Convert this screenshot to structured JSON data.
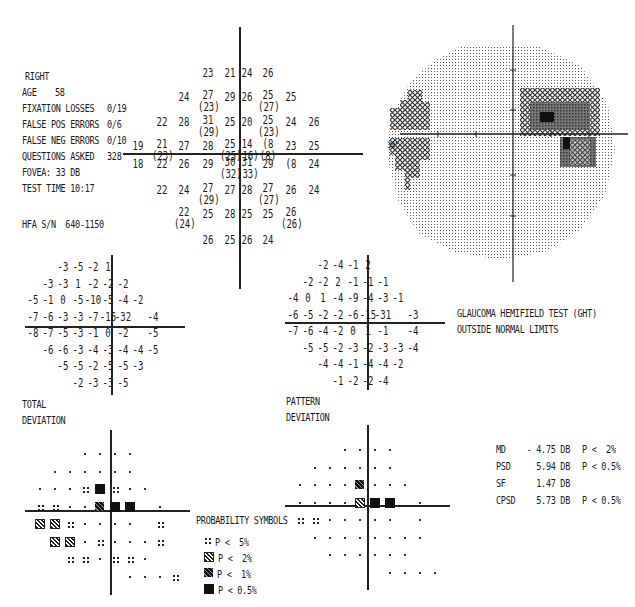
{
  "patient_info": {
    "eye": "RIGHT",
    "age_label": "AGE",
    "age_value": "58",
    "fixation_losses_label": "FIXATION LOSSES",
    "fixation_losses_value": "0/19",
    "false_pos_label": "FALSE POS ERRORS",
    "false_pos_value": "0/6",
    "false_neg_label": "FALSE NEG ERRORS",
    "false_neg_value": "0/10",
    "questions_label": "QUESTIONS ASKED",
    "questions_value": "328",
    "fovea": "FOVEA: 33 DB",
    "test_time": "TEST TIME 10:17",
    "hfa_sn": "HFA S/N  640-1150"
  },
  "threshold_map": {
    "rows": [
      {
        "y": 73,
        "cells": [
          [
            208,
            "23"
          ],
          [
            230,
            "21"
          ],
          [
            247,
            "24"
          ],
          [
            268,
            "26"
          ]
        ]
      },
      {
        "y": 97,
        "cells": [
          [
            184,
            "24"
          ],
          [
            208,
            "27",
            "(23)"
          ],
          [
            230,
            "29"
          ],
          [
            247,
            "26"
          ],
          [
            268,
            "25",
            "(27)"
          ],
          [
            291,
            "25"
          ]
        ]
      },
      {
        "y": 122,
        "cells": [
          [
            162,
            "22"
          ],
          [
            184,
            "28"
          ],
          [
            208,
            "31",
            "(29)"
          ],
          [
            230,
            "25"
          ],
          [
            247,
            "20"
          ],
          [
            268,
            "25",
            "(23)"
          ],
          [
            291,
            "24"
          ],
          [
            314,
            "26"
          ]
        ]
      },
      {
        "y": 146,
        "cells": [
          [
            138,
            "19"
          ],
          [
            162,
            "21",
            "(23)"
          ],
          [
            184,
            "27"
          ],
          [
            208,
            "28"
          ],
          [
            230,
            "25",
            "(25)"
          ],
          [
            247,
            "14",
            "(16)"
          ],
          [
            268,
            "(8",
            "(8)"
          ],
          [
            291,
            "23"
          ],
          [
            314,
            "25"
          ]
        ]
      },
      {
        "y": 164,
        "cells": [
          [
            138,
            "18"
          ],
          [
            162,
            "22"
          ],
          [
            184,
            "26"
          ],
          [
            208,
            "29"
          ],
          [
            230,
            "30",
            "(32)"
          ],
          [
            247,
            "31",
            "(33)"
          ],
          [
            268,
            "29"
          ],
          [
            291,
            "(8"
          ],
          [
            314,
            "24"
          ]
        ]
      },
      {
        "y": 190,
        "cells": [
          [
            162,
            "22"
          ],
          [
            184,
            "24"
          ],
          [
            208,
            "27",
            "(29)"
          ],
          [
            230,
            "27"
          ],
          [
            247,
            "28"
          ],
          [
            268,
            "27",
            "(27)"
          ],
          [
            291,
            "26"
          ],
          [
            314,
            "24"
          ]
        ]
      },
      {
        "y": 214,
        "cells": [
          [
            184,
            "22",
            "(24)"
          ],
          [
            208,
            "25"
          ],
          [
            230,
            "28"
          ],
          [
            247,
            "25"
          ],
          [
            268,
            "25"
          ],
          [
            291,
            "26",
            "(26)"
          ]
        ]
      },
      {
        "y": 240,
        "cells": [
          [
            208,
            "26"
          ],
          [
            230,
            "25"
          ],
          [
            247,
            "26"
          ],
          [
            268,
            "24"
          ]
        ]
      }
    ]
  },
  "grayscale_map": {
    "degree_label": "30°"
  },
  "total_deviation": {
    "label_line1": "TOTAL",
    "label_line2": "DEVIATION",
    "rows": [
      [
        "",
        "",
        "-3",
        "-5",
        "-2",
        "1",
        "",
        ""
      ],
      [
        "",
        "-3",
        "-3",
        "1",
        "-2",
        "-2",
        "-2",
        ""
      ],
      [
        "-5",
        "-1",
        "0",
        "-5",
        "-10",
        "-5",
        "-4",
        "-2"
      ],
      [
        "-7",
        "-6",
        "-3",
        "-3",
        "-7",
        "-16",
        "-32",
        "",
        "-4"
      ],
      [
        "-8",
        "-7",
        "-5",
        "-3",
        "-1",
        "0",
        "-2",
        "",
        "-5"
      ],
      [
        "",
        "-6",
        "-6",
        "-3",
        "-4",
        "-3",
        "-4",
        "-4",
        "-5"
      ],
      [
        "",
        "",
        "-5",
        "-5",
        "-2",
        "-5",
        "-5",
        "-3"
      ],
      [
        "",
        "",
        "",
        "-2",
        "-3",
        "-3",
        "-5"
      ]
    ]
  },
  "pattern_deviation": {
    "label_line1": "PATTERN",
    "label_line2": "DEVIATION",
    "rows": [
      [
        "",
        "",
        "-2",
        "-4",
        "-1",
        "2",
        "",
        ""
      ],
      [
        "",
        "-2",
        "-2",
        "2",
        "-1",
        "-1",
        "-1",
        ""
      ],
      [
        "-4",
        "0",
        "1",
        "-4",
        "-9",
        "-4",
        "-3",
        "-1"
      ],
      [
        "-6",
        "-5",
        "-2",
        "-2",
        "-6",
        "-15",
        "-31",
        "",
        "-3"
      ],
      [
        "-7",
        "-6",
        "-4",
        "-2",
        "0",
        "1",
        "-1",
        "",
        "-4"
      ],
      [
        "",
        "-5",
        "-5",
        "-2",
        "-3",
        "-2",
        "-3",
        "-3",
        "-4"
      ],
      [
        "",
        "",
        "-4",
        "-4",
        "-1",
        "-4",
        "-4",
        "-2"
      ],
      [
        "",
        "",
        "",
        "-1",
        "-2",
        "-2",
        "-4"
      ]
    ]
  },
  "ght": {
    "line1": "GLAUCOMA HEMIFIELD TEST (GHT)",
    "line2": "OUTSIDE NORMAL LIMITS"
  },
  "global_indices": [
    {
      "name": "MD",
      "value": "- 4.75 DB",
      "p": "P <  2%"
    },
    {
      "name": "PSD",
      "value": "5.94 DB",
      "p": "P < 0.5%"
    },
    {
      "name": "SF",
      "value": "1.47 DB",
      "p": ""
    },
    {
      "name": "CPSD",
      "value": "5.73 DB",
      "p": "P < 0.5%"
    }
  ],
  "probability_legend": {
    "title": "PROBABILITY SYMBOLS",
    "items": [
      {
        "symbol": "p5",
        "label": "P <  5%"
      },
      {
        "symbol": "p2",
        "label": "P <  2%"
      },
      {
        "symbol": "p1",
        "label": "P <  1%"
      },
      {
        "symbol": "p05",
        "label": "P < 0.5%"
      }
    ]
  },
  "total_prob_map": [
    [
      "n",
      "n",
      "n",
      "n"
    ],
    [
      "n",
      "n",
      "n",
      "n",
      "n",
      "n"
    ],
    [
      "n",
      "n",
      "n",
      "p5",
      "p05",
      "p5",
      "n",
      "n"
    ],
    [
      "p5",
      "p5",
      "n",
      "n",
      "p1",
      "p05",
      "p05",
      "",
      "n"
    ],
    [
      "p2",
      "p2",
      "p5",
      "n",
      "n",
      "n",
      "n",
      "",
      "p5"
    ],
    [
      "",
      "p2",
      "p2",
      "n",
      "p5",
      "n",
      "n",
      "n",
      "p5"
    ],
    [
      "",
      "",
      "p5",
      "p5",
      "n",
      "p5",
      "p5",
      "n"
    ],
    [
      "",
      "",
      "",
      "n",
      "n",
      "n",
      "p5"
    ]
  ],
  "pattern_prob_map": [
    [
      "n",
      "n",
      "n",
      "n"
    ],
    [
      "n",
      "n",
      "n",
      "n",
      "n",
      "n"
    ],
    [
      "n",
      "n",
      "n",
      "n",
      "p1",
      "n",
      "n",
      "n"
    ],
    [
      "n",
      "n",
      "n",
      "n",
      "p2",
      "p05",
      "p05",
      "",
      "n"
    ],
    [
      "p5",
      "p5",
      "n",
      "n",
      "n",
      "n",
      "n",
      "",
      "n"
    ],
    [
      "",
      "n",
      "n",
      "n",
      "n",
      "n",
      "n",
      "n",
      "n"
    ],
    [
      "",
      "",
      "n",
      "n",
      "n",
      "n",
      "n",
      "n"
    ],
    [
      "",
      "",
      "",
      "n",
      "n",
      "n",
      "n"
    ]
  ]
}
